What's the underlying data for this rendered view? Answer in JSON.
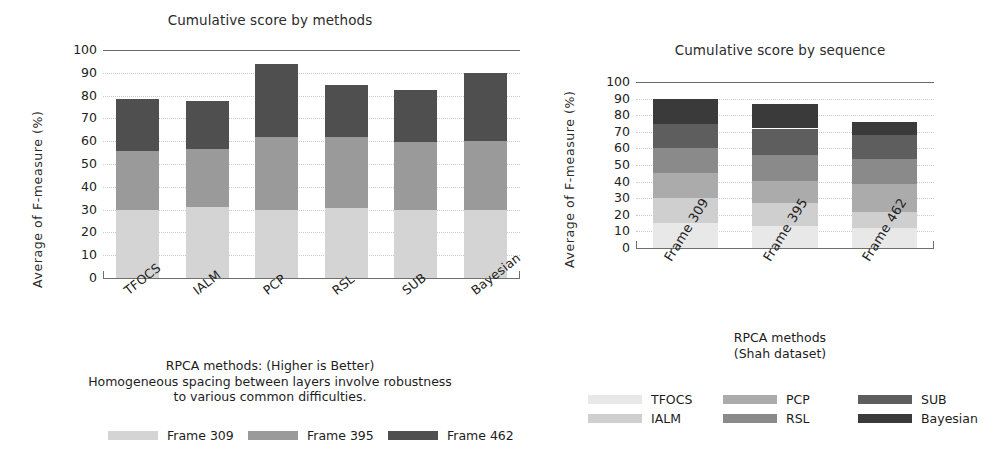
{
  "chart_data": [
    {
      "type": "bar",
      "id": "methods",
      "title": "Cumulative score by methods",
      "ylabel": "Average  of  F-measure  (%)",
      "xlabel": "RPCA methods: (Higher is Better)\nHomogeneous spacing between layers involve robustness\nto various common difficulties.",
      "categories": [
        "TFOCS",
        "IALM",
        "PCP",
        "RSL",
        "SUB",
        "Bayesian"
      ],
      "stacked": true,
      "series": [
        {
          "name": "Frame 309",
          "color": "#d4d4d4",
          "values": [
            30.0,
            31.0,
            30.0,
            30.5,
            30.0,
            30.0
          ]
        },
        {
          "name": "Frame 395",
          "color": "#9a9a9a",
          "values": [
            25.5,
            25.5,
            32.0,
            31.5,
            29.5,
            30.0
          ]
        },
        {
          "name": "Frame 462",
          "color": "#4f4f4f",
          "values": [
            23.0,
            21.0,
            32.0,
            22.5,
            23.0,
            30.0
          ]
        }
      ],
      "totals": [
        78.5,
        77.5,
        94.0,
        84.5,
        82.5,
        90.0
      ],
      "yticks": [
        0,
        10,
        20,
        30,
        40,
        50,
        60,
        70,
        80,
        90,
        100
      ],
      "ylim": [
        0,
        100
      ],
      "grid": true,
      "legend_position": "below"
    },
    {
      "type": "bar",
      "id": "sequence",
      "title": "Cumulative score by sequence",
      "ylabel": "Average  of  F-measure  (%)",
      "xlabel": "RPCA methods\n(Shah dataset)",
      "categories": [
        "Frame 309",
        "Frame 395",
        "Frame 462"
      ],
      "stacked": true,
      "series": [
        {
          "name": "TFOCS",
          "color": "#e8e8e8",
          "values": [
            15.0,
            13.5,
            12.0
          ]
        },
        {
          "name": "IALM",
          "color": "#cfcfcf",
          "values": [
            15.0,
            13.5,
            9.5
          ]
        },
        {
          "name": "PCP",
          "color": "#ababab",
          "values": [
            15.0,
            13.5,
            17.0
          ]
        },
        {
          "name": "RSL",
          "color": "#8a8a8a",
          "values": [
            15.0,
            15.5,
            15.0
          ]
        },
        {
          "name": "SUB",
          "color": "#5e5e5e",
          "values": [
            15.0,
            16.0,
            14.5
          ]
        },
        {
          "name": "Bayesian",
          "color": "#3a3a3a",
          "values": [
            15.0,
            15.0,
            8.0
          ]
        }
      ],
      "totals": [
        90.0,
        87.0,
        76.0
      ],
      "yticks": [
        0,
        10,
        20,
        30,
        40,
        50,
        60,
        70,
        80,
        90,
        100
      ],
      "ylim": [
        0,
        100
      ],
      "grid": true,
      "legend_position": "below"
    }
  ],
  "left": {
    "title": "Cumulative score by methods",
    "ylabel": "Average  of  F-measure  (%)",
    "caption": "RPCA methods: (Higher is Better)\nHomogeneous spacing between layers involve robustness\nto various common difficulties.",
    "yticks": [
      "100",
      "90",
      "80",
      "70",
      "60",
      "50",
      "40",
      "30",
      "20",
      "10",
      "0"
    ],
    "xticks": [
      "TFOCS",
      "IALM",
      "PCP",
      "RSL",
      "SUB",
      "Bayesian"
    ],
    "legend": [
      {
        "label": "Frame 309",
        "color": "#d4d4d4"
      },
      {
        "label": "Frame 395",
        "color": "#9a9a9a"
      },
      {
        "label": "Frame 462",
        "color": "#4f4f4f"
      }
    ]
  },
  "right": {
    "title": "Cumulative score by sequence",
    "ylabel": "Average  of  F-measure  (%)",
    "caption": "RPCA methods\n(Shah dataset)",
    "yticks": [
      "100",
      "90",
      "80",
      "70",
      "60",
      "50",
      "40",
      "30",
      "20",
      "10",
      "0"
    ],
    "xticks": [
      "Frame 309",
      "Frame 395",
      "Frame 462"
    ],
    "legend": [
      {
        "label": "TFOCS",
        "color": "#e8e8e8"
      },
      {
        "label": "IALM",
        "color": "#cfcfcf"
      },
      {
        "label": "PCP",
        "color": "#ababab"
      },
      {
        "label": "RSL",
        "color": "#8a8a8a"
      },
      {
        "label": "SUB",
        "color": "#5e5e5e"
      },
      {
        "label": "Bayesian",
        "color": "#3a3a3a"
      }
    ]
  }
}
